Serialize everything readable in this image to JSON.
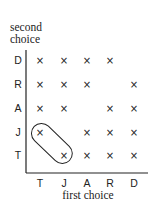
{
  "y_axis": {
    "label_line1": "second",
    "label_line2": "choice",
    "ticks": [
      "D",
      "R",
      "A",
      "J",
      "T"
    ]
  },
  "x_axis": {
    "label": "first choice",
    "ticks": [
      "T",
      "J",
      "A",
      "R",
      "D"
    ]
  },
  "marker_glyph": "×",
  "grid": {
    "rows": [
      {
        "second": "D",
        "marks": [
          true,
          true,
          true,
          true,
          false
        ]
      },
      {
        "second": "R",
        "marks": [
          true,
          true,
          true,
          false,
          true
        ]
      },
      {
        "second": "A",
        "marks": [
          true,
          true,
          false,
          true,
          true
        ]
      },
      {
        "second": "J",
        "marks": [
          true,
          false,
          true,
          true,
          true
        ]
      },
      {
        "second": "T",
        "marks": [
          false,
          true,
          true,
          true,
          true
        ]
      }
    ]
  },
  "highlight": {
    "description": "rounded outline enclosing (first T, second J) and (first J, second T)",
    "cells": [
      [
        "T",
        "J"
      ],
      [
        "J",
        "T"
      ]
    ]
  }
}
